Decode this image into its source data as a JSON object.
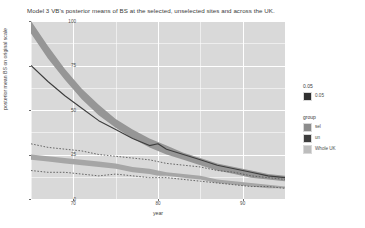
{
  "chart_data": {
    "type": "line",
    "title": "Model 3 VB's posterior means of BS at the selected, unselected sites and across the UK.",
    "xlabel": "year",
    "ylabel": "posterior mean BS on original scale",
    "xlim": [
      65,
      95
    ],
    "ylim": [
      0,
      100
    ],
    "grid": true,
    "legend_position": "right",
    "yticks": [
      "100",
      "75",
      "50",
      "25",
      "0"
    ],
    "ytick_values": [
      100,
      75,
      50,
      25,
      0
    ],
    "xticks": [
      "70",
      "80",
      "90"
    ],
    "xtick_values": [
      70,
      80,
      90
    ],
    "x": [
      65,
      67,
      69,
      71,
      73,
      75,
      77,
      79,
      80,
      81,
      83,
      85,
      87,
      89,
      91,
      93,
      95
    ],
    "series": [
      {
        "name": "sel",
        "style": "ribbon",
        "color": "#969696",
        "upper": [
          100,
          86,
          73,
          62,
          53,
          45,
          39,
          34,
          32,
          30,
          26,
          23,
          20,
          18,
          16,
          14,
          13
        ],
        "lower": [
          93,
          79,
          67,
          56,
          47,
          40,
          34,
          29,
          27,
          25,
          22,
          19,
          16,
          14,
          12,
          11,
          10
        ]
      },
      {
        "name": "unsel",
        "style": "solid",
        "color": "#3d3d3d",
        "values": [
          75,
          66,
          58,
          51,
          44,
          39,
          34,
          30,
          31,
          28,
          25,
          22,
          19,
          17,
          15,
          13,
          12
        ]
      },
      {
        "name": "Whole UK",
        "style": "ribbon",
        "color": "#a6a6a6",
        "upper": [
          25,
          24,
          23,
          22,
          21,
          20,
          18,
          17,
          16,
          15,
          14,
          13,
          11,
          10,
          9,
          8,
          7
        ],
        "lower": [
          22,
          21,
          20,
          19,
          18,
          17,
          15,
          14,
          13,
          13,
          12,
          11,
          9,
          8,
          7,
          6,
          6
        ]
      },
      {
        "name": "sel-interval-upper",
        "style": "dotted",
        "color": "#5a5a5a",
        "values": [
          31,
          29,
          28,
          27,
          25,
          24,
          23,
          22,
          21,
          20,
          19,
          18,
          16,
          15,
          13,
          12,
          11
        ]
      },
      {
        "name": "sel-interval-lower",
        "style": "dotted",
        "color": "#5a5a5a",
        "values": [
          16,
          15,
          15,
          14,
          13,
          14,
          13,
          12,
          12,
          12,
          11,
          10,
          9,
          8,
          7,
          7,
          6
        ]
      }
    ],
    "legends": [
      {
        "title": "0.05",
        "items": [
          {
            "label": "0.05",
            "color": "#303030"
          }
        ]
      },
      {
        "title": "group",
        "items": [
          {
            "label": "sel",
            "color": "#8c8c8c"
          },
          {
            "label": "un",
            "color": "#3d3d3d"
          },
          {
            "label": "Whole UK",
            "color": "#bdbdbd"
          }
        ]
      }
    ],
    "colors": {
      "panel_background": "#d9d9d9",
      "grid": "#ffffff",
      "page_background": "#ffffff",
      "text": "#4d4d4d"
    }
  }
}
